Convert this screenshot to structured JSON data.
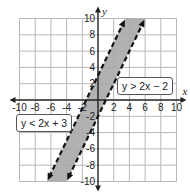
{
  "chart_data": {
    "type": "line",
    "title": "",
    "xlabel": "x",
    "ylabel": "y",
    "xlim": [
      -10,
      10
    ],
    "ylim": [
      -10,
      10
    ],
    "grid": true,
    "grid_step": 2,
    "x_ticks": [
      -10,
      -8,
      -6,
      -4,
      -2,
      2,
      4,
      6,
      8,
      10
    ],
    "y_ticks": [
      10,
      8,
      6,
      4,
      2,
      -2,
      -4,
      -6,
      -8,
      -10
    ],
    "x_tick_labels": [
      "-10",
      "-8",
      "-6",
      "-4",
      "-2",
      "2",
      "4",
      "6",
      "8",
      "10"
    ],
    "y_tick_labels": [
      "10",
      "8",
      "6",
      "4",
      "2",
      "-2",
      "-4",
      "-6",
      "-8",
      "-10"
    ],
    "series": [
      {
        "name": "y = 2x + 3",
        "slope": 2,
        "intercept": 3,
        "style": "dashed",
        "boundary_of": "y < 2x + 3"
      },
      {
        "name": "y = 2x - 2",
        "slope": 2,
        "intercept": -2,
        "style": "dashed",
        "boundary_of": "y > 2x - 2"
      }
    ],
    "shaded_region": {
      "description": "between y = 2x - 2 and y = 2x + 3",
      "color": "#a9a9a9"
    },
    "annotations": [
      {
        "text": "y > 2x − 2",
        "position": "right, near y-axis 2"
      },
      {
        "text": "y < 2x + 3",
        "position": "left, below x-axis"
      }
    ]
  },
  "labels": {
    "x_axis": "x",
    "y_axis": "y",
    "ineq_right": "y > 2x − 2",
    "ineq_left": "y < 2x + 3"
  },
  "colors": {
    "shade": "#a9a9a9",
    "grid": "#b8b8b8",
    "axis": "#222222",
    "boundary": "#111111"
  }
}
